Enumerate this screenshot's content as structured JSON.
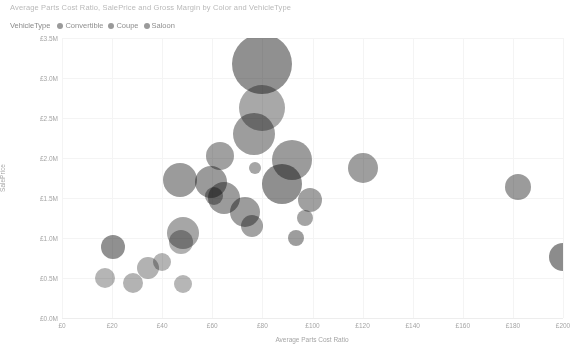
{
  "chart_data": {
    "type": "scatter",
    "title": "Average Parts Cost Ratio, SalePrice and Gross Margin by Color and VehicleType",
    "xlabel": "Average Parts Cost Ratio",
    "ylabel": "SalePrice",
    "xlim": [
      0,
      200
    ],
    "ylim": [
      0,
      3500000
    ],
    "grid": true,
    "legend_position": "top-left",
    "legend_title": "VehicleType",
    "legend_entries": [
      {
        "label": "Convertible",
        "color": "#9a9a9a"
      },
      {
        "label": "Coupe",
        "color": "#9a9a9a"
      },
      {
        "label": "Saloon",
        "color": "#9a9a9a"
      }
    ],
    "xticks": [
      "£0",
      "£20",
      "£40",
      "£60",
      "£80",
      "£100",
      "£120",
      "£140",
      "£160",
      "£180",
      "£200"
    ],
    "xtick_values": [
      0,
      20,
      40,
      60,
      80,
      100,
      120,
      140,
      160,
      180,
      200
    ],
    "yticks": [
      "£0.0M",
      "£0.5M",
      "£1.0M",
      "£1.5M",
      "£2.0M",
      "£2.5M",
      "£3.0M",
      "£3.5M"
    ],
    "ytick_values": [
      0,
      500000,
      1000000,
      1500000,
      2000000,
      2500000,
      3000000,
      3500000
    ],
    "size_encoding": "Gross Margin",
    "points": [
      {
        "x": 80.0,
        "y": 3180000,
        "r": 30,
        "shade": "#909090"
      },
      {
        "x": 80.0,
        "y": 2620000,
        "r": 23,
        "shade": "#a8a8a8"
      },
      {
        "x": 76.5,
        "y": 2300000,
        "r": 21,
        "shade": "#9d9d9d"
      },
      {
        "x": 63.0,
        "y": 2020000,
        "r": 14,
        "shade": "#a0a0a0"
      },
      {
        "x": 92.0,
        "y": 1980000,
        "r": 20,
        "shade": "#9b9b9b"
      },
      {
        "x": 88.0,
        "y": 1680000,
        "r": 20,
        "shade": "#8f8f8f"
      },
      {
        "x": 120.0,
        "y": 1880000,
        "r": 15,
        "shade": "#9e9e9e"
      },
      {
        "x": 182.0,
        "y": 1640000,
        "r": 13,
        "shade": "#9b9b9b"
      },
      {
        "x": 47.0,
        "y": 1720000,
        "r": 17,
        "shade": "#9b9b9b"
      },
      {
        "x": 59.5,
        "y": 1700000,
        "r": 16,
        "shade": "#9a9a9a"
      },
      {
        "x": 64.5,
        "y": 1500000,
        "r": 16,
        "shade": "#9b9b9b"
      },
      {
        "x": 60.5,
        "y": 1520000,
        "r": 9,
        "shade": "#a3a3a3"
      },
      {
        "x": 73.0,
        "y": 1320000,
        "r": 15,
        "shade": "#9c9c9c"
      },
      {
        "x": 76.0,
        "y": 1150000,
        "r": 11,
        "shade": "#a2a2a2"
      },
      {
        "x": 99.0,
        "y": 1480000,
        "r": 12,
        "shade": "#a0a0a0"
      },
      {
        "x": 97.0,
        "y": 1250000,
        "r": 8,
        "shade": "#a4a4a4"
      },
      {
        "x": 93.5,
        "y": 1000000,
        "r": 8,
        "shade": "#9d9d9d"
      },
      {
        "x": 48.5,
        "y": 1060000,
        "r": 16,
        "shade": "#a6a6a6"
      },
      {
        "x": 47.5,
        "y": 950000,
        "r": 12,
        "shade": "#b0b0b0"
      },
      {
        "x": 20.5,
        "y": 890000,
        "r": 12,
        "shade": "#909090"
      },
      {
        "x": 34.5,
        "y": 620000,
        "r": 11,
        "shade": "#b2b2b2"
      },
      {
        "x": 40.0,
        "y": 700000,
        "r": 9,
        "shade": "#b4b4b4"
      },
      {
        "x": 17.0,
        "y": 500000,
        "r": 10,
        "shade": "#b5b5b5"
      },
      {
        "x": 28.5,
        "y": 440000,
        "r": 10,
        "shade": "#b3b3b3"
      },
      {
        "x": 48.5,
        "y": 430000,
        "r": 9,
        "shade": "#b6b6b6"
      },
      {
        "x": 200.0,
        "y": 760000,
        "r": 14,
        "shade": "#8c8c8c"
      },
      {
        "x": 77.0,
        "y": 1870000,
        "r": 6,
        "shade": "#a5a5a5"
      }
    ]
  }
}
